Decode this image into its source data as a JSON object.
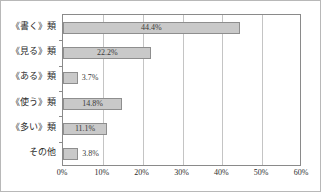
{
  "chart_data": {
    "type": "bar",
    "orientation": "horizontal",
    "title": "",
    "subtitle": "",
    "xlabel": "",
    "ylabel": "",
    "categories": [
      "《書く》類",
      "《見る》類",
      "《ある》類",
      "《使う》類",
      "《多い》類",
      "その他"
    ],
    "values": [
      44.4,
      22.2,
      3.7,
      14.8,
      11.1,
      3.8
    ],
    "data_labels": [
      "44.4%",
      "22.2%",
      "3.7%",
      "14.8%",
      "11.1%",
      "3.8%"
    ],
    "label_placement": [
      "inside",
      "inside",
      "outside",
      "inside",
      "inside",
      "outside"
    ],
    "xlim": [
      0,
      60
    ],
    "xticks": [
      0,
      10,
      20,
      30,
      40,
      50,
      60
    ],
    "xticklabels": [
      "0%",
      "10%",
      "20%",
      "30%",
      "40%",
      "50%",
      "60%"
    ],
    "grid": true,
    "grid_axis": "x",
    "legend": false,
    "colors": {
      "bar_fill": "#c9c9c9",
      "bar_border": "#8e8e8e",
      "gridline": "#c4c4c4",
      "axis": "#8a8a8a",
      "text": "#2b2b2b",
      "frame": "#b8b8b8",
      "background": "#ffffff"
    }
  }
}
